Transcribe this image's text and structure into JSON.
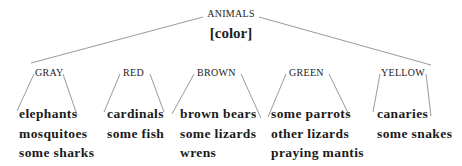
{
  "root": {
    "title": "ANIMALS",
    "subtitle": "[color]"
  },
  "categories": [
    {
      "label": "GRAY",
      "items": [
        "elephants",
        "mosquitoes",
        "some sharks"
      ]
    },
    {
      "label": "RED",
      "items": [
        "cardinals",
        "some fish"
      ]
    },
    {
      "label": "BROWN",
      "items": [
        "brown bears",
        "some lizards",
        "wrens"
      ]
    },
    {
      "label": "GREEN",
      "items": [
        "some parrots",
        "other lizards",
        "praying mantis"
      ]
    },
    {
      "label": "YELLOW",
      "items": [
        "canaries",
        "some snakes"
      ]
    }
  ],
  "colors": {
    "line": "#9a9a9a",
    "text": "#222222",
    "background": "#ffffff"
  }
}
